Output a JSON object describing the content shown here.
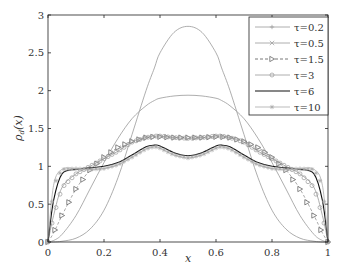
{
  "chart_data": {
    "type": "line",
    "title": "",
    "xlabel": "x",
    "ylabel": "ρ_d(x)",
    "xlim": [
      0,
      1
    ],
    "ylim": [
      0,
      3
    ],
    "xticks": [
      "0",
      "0.2",
      "0.4",
      "0.6",
      "0.8",
      "1"
    ],
    "yticks": [
      "0",
      "0.5",
      "1",
      "1.5",
      "2",
      "2.5",
      "3"
    ],
    "grid": false,
    "legend_position": "upper right",
    "x": [
      0,
      0.02,
      0.05,
      0.1,
      0.15,
      0.2,
      0.25,
      0.3,
      0.35,
      0.38,
      0.4,
      0.45,
      0.5,
      0.55,
      0.6,
      0.62,
      0.65,
      0.7,
      0.75,
      0.8,
      0.85,
      0.9,
      0.95,
      0.98,
      1
    ],
    "series": [
      {
        "name": "τ=0.2",
        "marker": "+",
        "linestyle": "solid",
        "color": "#999999",
        "values": [
          0,
          0,
          0.01,
          0.05,
          0.17,
          0.42,
          0.85,
          1.42,
          2.0,
          2.3,
          2.5,
          2.77,
          2.85,
          2.77,
          2.5,
          2.3,
          2.0,
          1.42,
          0.85,
          0.42,
          0.17,
          0.05,
          0.01,
          0,
          0
        ]
      },
      {
        "name": "τ=0.5",
        "marker": "x",
        "linestyle": "solid",
        "color": "#999999",
        "values": [
          0,
          0.02,
          0.1,
          0.35,
          0.7,
          1.05,
          1.37,
          1.63,
          1.8,
          1.87,
          1.9,
          1.93,
          1.94,
          1.93,
          1.9,
          1.87,
          1.8,
          1.63,
          1.37,
          1.05,
          0.7,
          0.35,
          0.1,
          0.02,
          0
        ]
      },
      {
        "name": "τ=1.5",
        "marker": "triangle-right",
        "linestyle": "dashed",
        "color": "#555555",
        "values": [
          0,
          0.12,
          0.35,
          0.7,
          0.95,
          1.12,
          1.25,
          1.33,
          1.38,
          1.39,
          1.39,
          1.38,
          1.38,
          1.38,
          1.39,
          1.39,
          1.38,
          1.33,
          1.25,
          1.12,
          0.95,
          0.7,
          0.35,
          0.12,
          0
        ]
      },
      {
        "name": "τ=3",
        "marker": "circle",
        "linestyle": "solid",
        "color": "#999999",
        "values": [
          0,
          0.35,
          0.72,
          0.9,
          1.0,
          1.1,
          1.2,
          1.32,
          1.38,
          1.4,
          1.4,
          1.38,
          1.37,
          1.38,
          1.4,
          1.4,
          1.38,
          1.32,
          1.2,
          1.1,
          1.0,
          0.9,
          0.72,
          0.35,
          0
        ]
      },
      {
        "name": "τ=6",
        "marker": "none",
        "linestyle": "solid",
        "color": "#111111",
        "values": [
          0,
          0.55,
          0.9,
          0.96,
          0.98,
          1.0,
          1.05,
          1.15,
          1.26,
          1.28,
          1.27,
          1.18,
          1.14,
          1.18,
          1.27,
          1.28,
          1.26,
          1.15,
          1.05,
          1.0,
          0.98,
          0.96,
          0.9,
          0.55,
          0
        ]
      },
      {
        "name": "τ=10",
        "marker": "star",
        "linestyle": "solid",
        "color": "#aaaaaa",
        "values": [
          0,
          0.75,
          0.96,
          0.97,
          0.96,
          0.97,
          1.02,
          1.12,
          1.23,
          1.26,
          1.24,
          1.15,
          1.11,
          1.15,
          1.24,
          1.26,
          1.23,
          1.12,
          1.02,
          0.97,
          0.96,
          0.97,
          0.96,
          0.75,
          0
        ]
      }
    ]
  }
}
